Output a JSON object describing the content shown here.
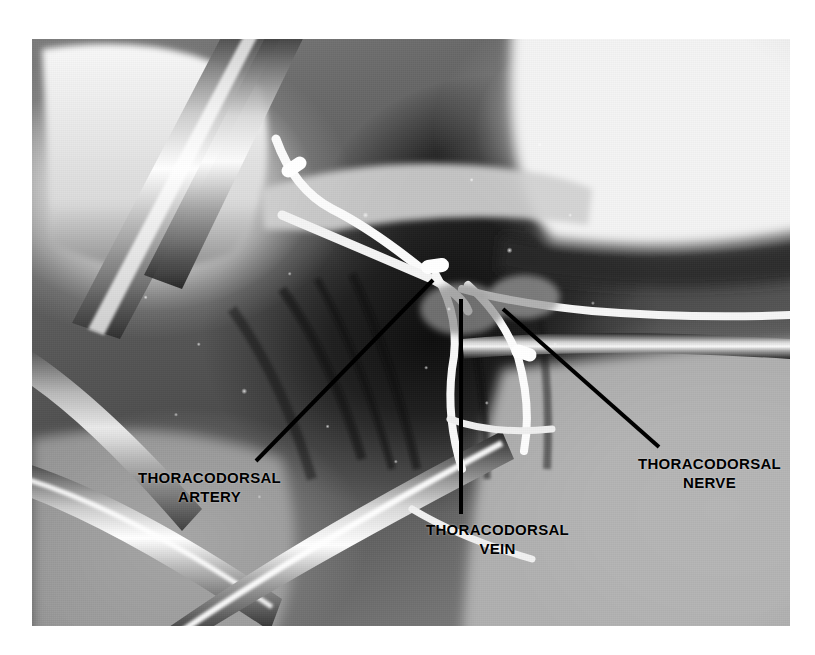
{
  "figure": {
    "kind": "surgical-photograph",
    "photo": {
      "left": 32,
      "top": 39,
      "width": 758,
      "height": 587,
      "background_color": "#6d6d6d",
      "border_color": "#ffffff"
    }
  },
  "page": {
    "background_color": "#ffffff"
  },
  "annotations": {
    "text_color": "#000000",
    "leader_color": "#000000",
    "items": [
      {
        "id": "artery",
        "name": "thoracodorsal-artery",
        "line1": "THORACODORSAL",
        "line2": "ARTERY",
        "label_x": 138,
        "label_y": 468,
        "leader": {
          "x1": 433,
          "y1": 280,
          "x2": 256,
          "y2": 461
        }
      },
      {
        "id": "vein",
        "name": "thoracodorsal-vein",
        "line1": "THORACODORSAL",
        "line2": "VEIN",
        "label_x": 426,
        "label_y": 520,
        "leader": {
          "x1": 461,
          "y1": 299,
          "x2": 461,
          "y2": 514
        }
      },
      {
        "id": "nerve",
        "name": "thoracodorsal-nerve",
        "line1": "THORACODORSAL",
        "line2": "NERVE",
        "label_x": 638,
        "label_y": 454,
        "leader": {
          "x1": 503,
          "y1": 309,
          "x2": 659,
          "y2": 447
        }
      }
    ]
  },
  "scene": {
    "instruments": [
      {
        "name": "retractor-blade-upper-left",
        "tone": "metal-bright"
      },
      {
        "name": "retractor-shaft-left",
        "tone": "metal-bright"
      },
      {
        "name": "forceps-lower-left",
        "tone": "metal-bright"
      },
      {
        "name": "clamp-lower-centre",
        "tone": "metal-bright"
      }
    ],
    "vessel_loops": [
      {
        "name": "vessel-loop-upper",
        "tone": "white"
      },
      {
        "name": "vessel-loop-pedicle",
        "tone": "white"
      },
      {
        "name": "vessel-loop-right",
        "tone": "white"
      },
      {
        "name": "vessel-loop-lower",
        "tone": "white"
      }
    ],
    "tissue": [
      {
        "name": "skin-flap-upper-left",
        "tone": "bright"
      },
      {
        "name": "skin-flap-upper-right",
        "tone": "bright"
      },
      {
        "name": "skin-flap-lower-right",
        "tone": "mid-gray"
      },
      {
        "name": "axillary-wound-bed",
        "tone": "dark"
      }
    ]
  }
}
